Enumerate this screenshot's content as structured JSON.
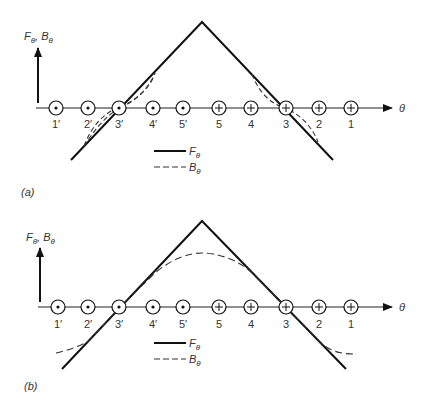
{
  "figure": {
    "panels": [
      {
        "id": "a",
        "caption": "(a)",
        "axis_y_label": "F",
        "axis_y_label_sub": "θ",
        "axis_y_label2": "B",
        "axis_y_label2_sub": "θ",
        "axis_x_label": "θ",
        "conductors": [
          {
            "label": "1′",
            "type": "dot"
          },
          {
            "label": "2′",
            "type": "dot"
          },
          {
            "label": "3′",
            "type": "dot"
          },
          {
            "label": "4′",
            "type": "dot"
          },
          {
            "label": "5′",
            "type": "dot"
          },
          {
            "label": "5",
            "type": "cross"
          },
          {
            "label": "4",
            "type": "cross"
          },
          {
            "label": "3",
            "type": "cross"
          },
          {
            "label": "2",
            "type": "cross"
          },
          {
            "label": "1",
            "type": "cross"
          }
        ],
        "legend": [
          {
            "style": "solid",
            "label": "F",
            "sub": "θ"
          },
          {
            "style": "dashed",
            "label": "B",
            "sub": "θ"
          }
        ]
      },
      {
        "id": "b",
        "caption": "(b)",
        "axis_y_label": "F",
        "axis_y_label_sub": "θ",
        "axis_y_label2": "B",
        "axis_y_label2_sub": "θ",
        "axis_x_label": "θ",
        "conductors": [
          {
            "label": "1′",
            "type": "dot"
          },
          {
            "label": "2′",
            "type": "dot"
          },
          {
            "label": "3′",
            "type": "dot"
          },
          {
            "label": "4′",
            "type": "dot"
          },
          {
            "label": "5′",
            "type": "dot"
          },
          {
            "label": "5",
            "type": "cross"
          },
          {
            "label": "4",
            "type": "cross"
          },
          {
            "label": "3",
            "type": "cross"
          },
          {
            "label": "2",
            "type": "cross"
          },
          {
            "label": "1",
            "type": "cross"
          }
        ],
        "legend": [
          {
            "style": "solid",
            "label": "F",
            "sub": "θ"
          },
          {
            "style": "dashed",
            "label": "B",
            "sub": "θ"
          }
        ]
      }
    ]
  }
}
